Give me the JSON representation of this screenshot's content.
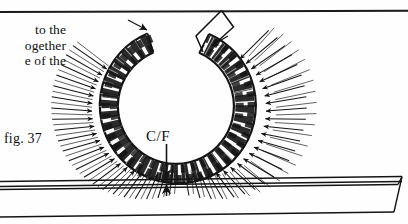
{
  "page": {
    "width": 408,
    "height": 224,
    "background": "#fefefe",
    "ink": "#141414"
  },
  "body_text": {
    "lines": [
      "to  the",
      "ogether",
      "e of the"
    ]
  },
  "figure": {
    "label": "fig. 37",
    "caption_annotation": "C/F",
    "annotation_name": "centre-of-figure-marker"
  },
  "diagram": {
    "type": "architectural-section",
    "elements": [
      {
        "name": "arch-ring",
        "description": "near-circular voussoir ring, open at crown"
      },
      {
        "name": "radial-load-arrows",
        "description": "hatched arrows radiating inward toward the ring"
      },
      {
        "name": "crown-gap",
        "description": "open gap at the top between the two ring ends"
      },
      {
        "name": "angled-guide-line",
        "description": "V-shaped construction line rising from right ring end"
      },
      {
        "name": "down-arrow",
        "description": "arrow pointing down to the springing line at C/F"
      },
      {
        "name": "up-arrow",
        "description": "arrow pointing up from the beam at C/F"
      },
      {
        "name": "support-beam",
        "description": "horizontal beam / floor slab below the arch with slanted right end"
      }
    ],
    "ring": {
      "center_x": 178,
      "center_y": 110,
      "outer_radius": 78,
      "inner_radius": 58,
      "crown_gap_degrees": 38
    }
  }
}
